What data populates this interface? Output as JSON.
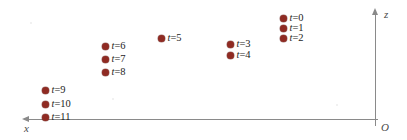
{
  "figure": {
    "background_color": "#ffffff",
    "point_color": "#8f2b23",
    "axis_color": "#8a8a8a",
    "label_color": "#1d1d1d"
  },
  "axes": {
    "x_axis": {
      "label": "x",
      "direction": "left",
      "y_pixel": 119
    },
    "z_axis": {
      "label": "z",
      "direction": "up",
      "x_pixel": 375
    },
    "origin": {
      "label": "O"
    }
  },
  "chart_data": {
    "type": "scatter",
    "title": "",
    "xlabel": "x",
    "ylabel": "z",
    "grid": false,
    "legend": "none",
    "note": "x axis increases to the left; origin O is at the lower right. Coordinates given in pixel space of the figure (origin at O).",
    "series": [
      {
        "name": "trajectory",
        "color": "#8f2b23",
        "points": [
          {
            "label": "t=0",
            "t": 0,
            "px": 283,
            "py": 18,
            "x_from_origin": 92,
            "z_from_origin": 101,
            "label_side": "right"
          },
          {
            "label": "t=1",
            "t": 1,
            "px": 283,
            "py": 28,
            "x_from_origin": 92,
            "z_from_origin": 91,
            "label_side": "right"
          },
          {
            "label": "t=2",
            "t": 2,
            "px": 283,
            "py": 38,
            "x_from_origin": 92,
            "z_from_origin": 81,
            "label_side": "right"
          },
          {
            "label": "t=3",
            "t": 3,
            "px": 230,
            "py": 44,
            "x_from_origin": 145,
            "z_from_origin": 75,
            "label_side": "right"
          },
          {
            "label": "t=4",
            "t": 4,
            "px": 230,
            "py": 55,
            "x_from_origin": 145,
            "z_from_origin": 64,
            "label_side": "right"
          },
          {
            "label": "t=5",
            "t": 5,
            "px": 161,
            "py": 38,
            "x_from_origin": 214,
            "z_from_origin": 81,
            "label_side": "right"
          },
          {
            "label": "t=6",
            "t": 6,
            "px": 105,
            "py": 46,
            "x_from_origin": 270,
            "z_from_origin": 73,
            "label_side": "right"
          },
          {
            "label": "t=7",
            "t": 7,
            "px": 105,
            "py": 59,
            "x_from_origin": 270,
            "z_from_origin": 60,
            "label_side": "right"
          },
          {
            "label": "t=8",
            "t": 8,
            "px": 105,
            "py": 72,
            "x_from_origin": 270,
            "z_from_origin": 47,
            "label_side": "right"
          },
          {
            "label": "t=9",
            "t": 9,
            "px": 45,
            "py": 90,
            "x_from_origin": 330,
            "z_from_origin": 29,
            "label_side": "right"
          },
          {
            "label": "t=10",
            "t": 10,
            "px": 45,
            "py": 104,
            "x_from_origin": 330,
            "z_from_origin": 15,
            "label_side": "right"
          },
          {
            "label": "t=11",
            "t": 11,
            "px": 45,
            "py": 117,
            "x_from_origin": 330,
            "z_from_origin": 2,
            "label_side": "right"
          }
        ]
      }
    ],
    "labels": {
      "t0": "t=0",
      "t1": "t=1",
      "t2": "t=2",
      "t3": "t=3",
      "t4": "t=4",
      "t5": "t=5",
      "t6": "t=6",
      "t7": "t=7",
      "t8": "t=8",
      "t9": "t=9",
      "t10": "t=10",
      "t11": "t=11"
    }
  }
}
